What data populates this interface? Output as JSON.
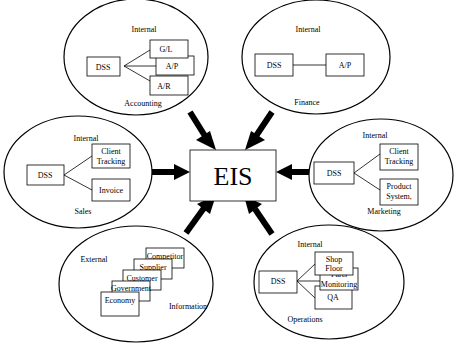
{
  "center": {
    "label": "EIS"
  },
  "modules": {
    "accounting": {
      "scope": "Internal",
      "name": "Accounting",
      "dss": "DSS",
      "systems": [
        "G/L",
        "A/P",
        "A/R"
      ]
    },
    "finance": {
      "scope": "Internal",
      "name": "Finance",
      "dss": "DSS",
      "systems": [
        "A/P"
      ]
    },
    "sales": {
      "scope": "Internal",
      "name": "Sales",
      "dss": "DSS",
      "systems": [
        "Client",
        "Tracking",
        "Invoice"
      ]
    },
    "marketing": {
      "scope": "Internal",
      "name": "Marketing",
      "dss": "DSS",
      "systems": [
        "Client",
        "Tracking",
        "Product",
        "System,"
      ]
    },
    "information": {
      "scope": "External",
      "name": "Information",
      "sources": [
        "Competitor",
        "Supplier",
        "Customer",
        "Government",
        "Economy"
      ]
    },
    "operations": {
      "scope": "Internal",
      "name": "Operations",
      "dss": "DSS",
      "systems": [
        "Shop",
        "Floor",
        "Parts",
        "Monitoring",
        "QA"
      ]
    }
  }
}
